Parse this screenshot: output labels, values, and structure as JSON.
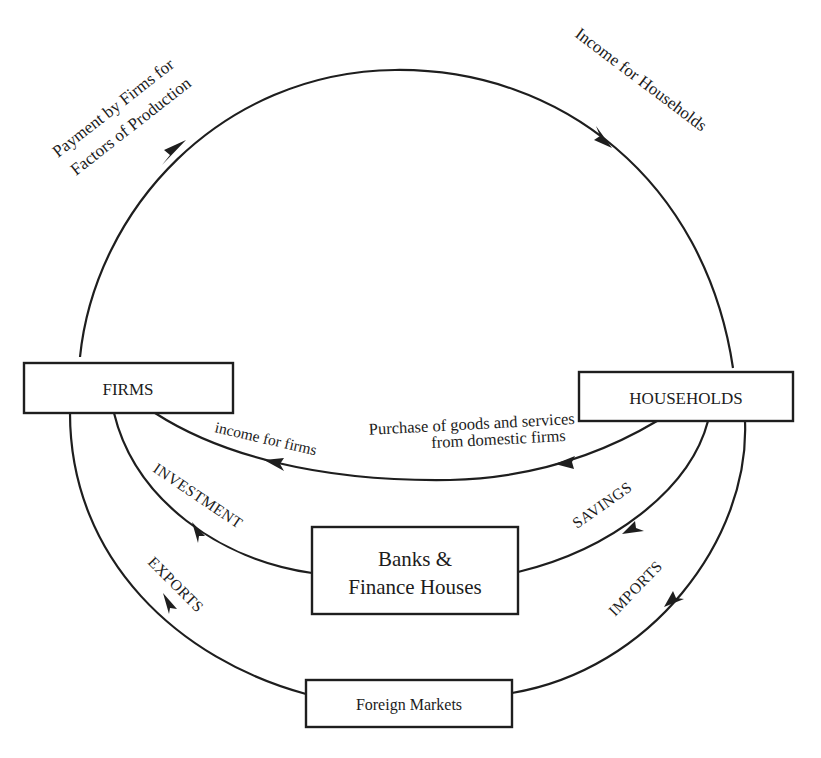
{
  "diagram": {
    "nodes": {
      "firms": {
        "label": "FIRMS"
      },
      "households": {
        "label": "HOUSEHOLDS"
      },
      "banks": {
        "label_line1": "Banks &",
        "label_line2": "Finance Houses"
      },
      "foreign": {
        "label": "Foreign Markets"
      }
    },
    "flows": {
      "payment": {
        "line1": "Payment by Firms for",
        "line2": "Factors of Production",
        "from": "firms",
        "to": "households"
      },
      "income_households": {
        "label": "Income for Households"
      },
      "purchase": {
        "line1": "Purchase of goods and services",
        "line2": "from domestic firms",
        "from": "households",
        "to": "firms"
      },
      "income_firms": {
        "label": "income for firms"
      },
      "savings": {
        "label": "SAVINGS",
        "from": "households",
        "to": "banks"
      },
      "investment": {
        "label": "INVESTMENT",
        "from": "banks",
        "to": "firms"
      },
      "imports": {
        "label": "IMPORTS",
        "from": "households",
        "to": "foreign"
      },
      "exports": {
        "label": "EXPORTS",
        "from": "foreign",
        "to": "firms"
      }
    },
    "colors": {
      "ink": "#1e1e1e",
      "background": "#ffffff"
    }
  }
}
